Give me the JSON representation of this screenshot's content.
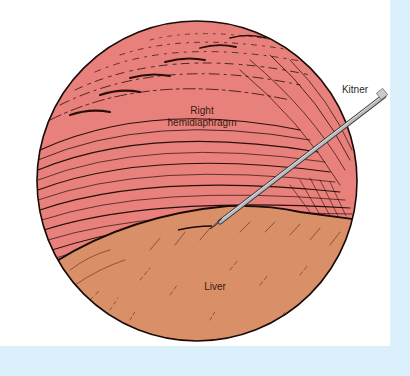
{
  "figure": {
    "labels": {
      "diaphragm_line1": "Right",
      "diaphragm_line2": "hemidiaphragm",
      "liver": "Liver",
      "instrument": "Kitner"
    },
    "colors": {
      "diaphragm": "#e8817b",
      "liver": "#d99068",
      "outline": "#1a0a08",
      "frame": "#dcf0fb",
      "instrument": "#b8bcc0"
    }
  }
}
